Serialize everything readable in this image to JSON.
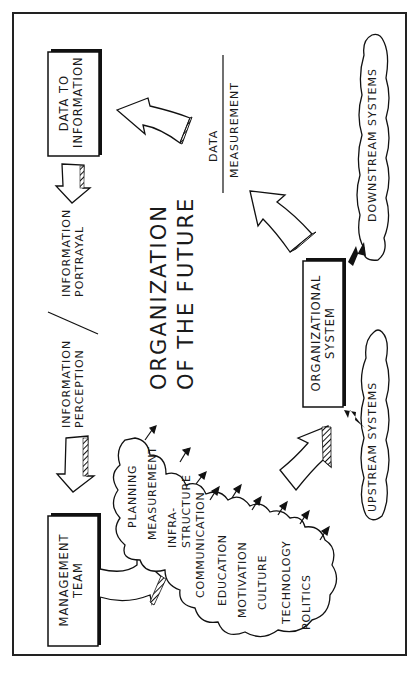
{
  "diagram": {
    "title": [
      "ORGANIZATION",
      "OF THE FUTURE"
    ],
    "boxes": {
      "data_to_information": [
        "DATA TO",
        "INFORMATION"
      ],
      "management_team": [
        "MANAGEMENT",
        "TEAM"
      ],
      "organizational_system": [
        "ORGANIZATIONAL",
        "SYSTEM"
      ]
    },
    "flow_labels": {
      "information_perception": [
        "INFORMATION",
        "PERCEPTION"
      ],
      "information_portrayal": [
        "INFORMATION",
        "PORTRAYAL"
      ],
      "data": "DATA",
      "measurement": "MEASUREMENT"
    },
    "clouds": {
      "downstream": "DOWNSTREAM SYSTEMS",
      "upstream": "UPSTREAM SYSTEMS",
      "management_factors": [
        "PLANNING",
        "MEASUREMENT",
        "INFRA-",
        "STRUCTURE",
        "COMMUNICATION",
        "EDUCATION",
        "MOTIVATION",
        "CULTURE",
        "TECHNOLOGY",
        "POLITICS"
      ]
    },
    "colors": {
      "ink": "#1a1a1a",
      "paper": "#ffffff"
    }
  }
}
